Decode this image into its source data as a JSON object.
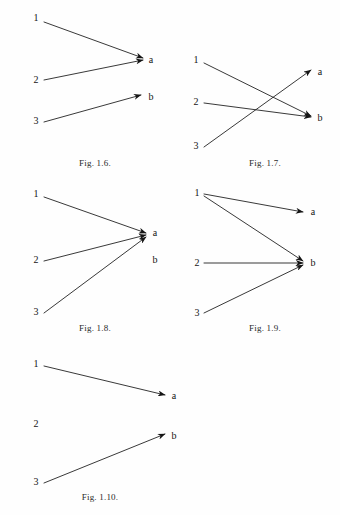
{
  "page": {
    "width": 340,
    "height": 515,
    "background_color": "#fefefe",
    "ink_color": "#151515"
  },
  "figures": [
    {
      "id": "fig-1-6",
      "caption": "Fig. 1.6.",
      "caption_x": 95,
      "caption_y": 158,
      "left_labels": [
        {
          "text": "1",
          "x": 36,
          "y": 18
        },
        {
          "text": "2",
          "x": 36,
          "y": 80
        },
        {
          "text": "3",
          "x": 36,
          "y": 121
        }
      ],
      "right_labels": [
        {
          "text": "a",
          "x": 151,
          "y": 60
        },
        {
          "text": "b",
          "x": 151,
          "y": 97
        }
      ],
      "arrows": [
        {
          "from": "1",
          "to": "a",
          "x1": 44,
          "y1": 22,
          "x2": 143,
          "y2": 58
        },
        {
          "from": "2",
          "to": "a",
          "x1": 44,
          "y1": 80,
          "x2": 143,
          "y2": 60
        },
        {
          "from": "3",
          "to": "b",
          "x1": 44,
          "y1": 122,
          "x2": 141,
          "y2": 95
        }
      ]
    },
    {
      "id": "fig-1-7",
      "caption": "Fig. 1.7.",
      "caption_x": 265,
      "caption_y": 158,
      "left_labels": [
        {
          "text": "1",
          "x": 196,
          "y": 60
        },
        {
          "text": "2",
          "x": 196,
          "y": 102
        },
        {
          "text": "3",
          "x": 196,
          "y": 146
        }
      ],
      "right_labels": [
        {
          "text": "a",
          "x": 320,
          "y": 72
        },
        {
          "text": "b",
          "x": 320,
          "y": 118
        }
      ],
      "arrows": [
        {
          "from": "1",
          "to": "b",
          "x1": 204,
          "y1": 63,
          "x2": 311,
          "y2": 116
        },
        {
          "from": "2",
          "to": "b",
          "x1": 204,
          "y1": 103,
          "x2": 311,
          "y2": 117
        },
        {
          "from": "3",
          "to": "a",
          "x1": 204,
          "y1": 147,
          "x2": 311,
          "y2": 70
        }
      ]
    },
    {
      "id": "fig-1-8",
      "caption": "Fig. 1.8.",
      "caption_x": 95,
      "caption_y": 323,
      "left_labels": [
        {
          "text": "1",
          "x": 36,
          "y": 194
        },
        {
          "text": "2",
          "x": 36,
          "y": 260
        },
        {
          "text": "3",
          "x": 36,
          "y": 312
        }
      ],
      "right_labels": [
        {
          "text": "a",
          "x": 155,
          "y": 233
        },
        {
          "text": "b",
          "x": 155,
          "y": 260
        }
      ],
      "arrows": [
        {
          "from": "1",
          "to": "a",
          "x1": 44,
          "y1": 197,
          "x2": 146,
          "y2": 233
        },
        {
          "from": "2",
          "to": "a",
          "x1": 44,
          "y1": 261,
          "x2": 146,
          "y2": 235
        },
        {
          "from": "3",
          "to": "a",
          "x1": 44,
          "y1": 313,
          "x2": 146,
          "y2": 237
        }
      ]
    },
    {
      "id": "fig-1-9",
      "caption": "Fig. 1.9.",
      "caption_x": 265,
      "caption_y": 323,
      "left_labels": [
        {
          "text": "1",
          "x": 197,
          "y": 193
        },
        {
          "text": "2",
          "x": 197,
          "y": 263
        },
        {
          "text": "3",
          "x": 197,
          "y": 313
        }
      ],
      "right_labels": [
        {
          "text": "a",
          "x": 313,
          "y": 212
        },
        {
          "text": "b",
          "x": 313,
          "y": 263
        }
      ],
      "arrows": [
        {
          "from": "1",
          "to": "a",
          "x1": 204,
          "y1": 194,
          "x2": 303,
          "y2": 212
        },
        {
          "from": "1",
          "to": "b",
          "x1": 204,
          "y1": 196,
          "x2": 303,
          "y2": 261
        },
        {
          "from": "2",
          "to": "b",
          "x1": 204,
          "y1": 263,
          "x2": 303,
          "y2": 263
        },
        {
          "from": "3",
          "to": "b",
          "x1": 204,
          "y1": 313,
          "x2": 303,
          "y2": 265
        }
      ]
    },
    {
      "id": "fig-1-10",
      "caption": "Fig. 1.10.",
      "caption_x": 100,
      "caption_y": 492,
      "left_labels": [
        {
          "text": "1",
          "x": 36,
          "y": 364
        },
        {
          "text": "2",
          "x": 36,
          "y": 424
        },
        {
          "text": "3",
          "x": 36,
          "y": 482
        }
      ],
      "right_labels": [
        {
          "text": "a",
          "x": 174,
          "y": 396
        },
        {
          "text": "b",
          "x": 174,
          "y": 436
        }
      ],
      "arrows": [
        {
          "from": "1",
          "to": "a",
          "x1": 44,
          "y1": 366,
          "x2": 165,
          "y2": 395
        },
        {
          "from": "3",
          "to": "b",
          "x1": 44,
          "y1": 483,
          "x2": 165,
          "y2": 434
        }
      ]
    }
  ]
}
